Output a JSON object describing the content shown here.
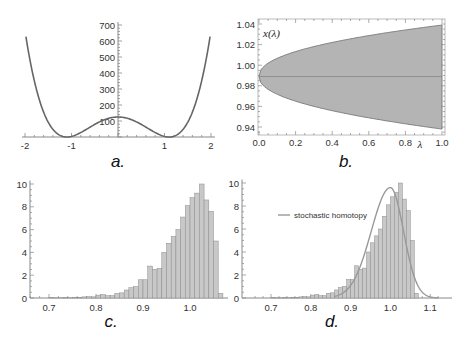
{
  "chart_data": [
    {
      "id": "a",
      "type": "line",
      "panel_label": "a.",
      "title": "",
      "xlabel": "",
      "ylabel": "",
      "x_ticks": [
        "-2",
        "-1",
        "1",
        "2"
      ],
      "y_ticks": [
        "100",
        "200",
        "300",
        "400",
        "500",
        "600",
        "700"
      ],
      "xlim": [
        -2,
        2
      ],
      "ylim": [
        0,
        700
      ],
      "description": "Double-well potential with minima near x = ±1.1 (value ~0) and local max ~125 at x = 0",
      "series": [
        {
          "name": "potential",
          "color": "#666666",
          "x": [
            -2.0,
            -1.8,
            -1.6,
            -1.4,
            -1.2,
            -1.1,
            -1.0,
            -0.8,
            -0.6,
            -0.4,
            -0.2,
            0.0,
            0.2,
            0.4,
            0.6,
            0.8,
            1.0,
            1.1,
            1.2,
            1.4,
            1.6,
            1.8,
            2.0
          ],
          "y": [
            690,
            420,
            225,
            90,
            12,
            0,
            5,
            45,
            88,
            113,
            123,
            125,
            123,
            113,
            88,
            45,
            5,
            0,
            12,
            90,
            225,
            420,
            690
          ]
        }
      ],
      "grid": false
    },
    {
      "id": "b",
      "type": "area",
      "panel_label": "b.",
      "title": "",
      "xlabel": "λ",
      "ylabel": "x(λ)",
      "x_ticks": [
        "0.0",
        "0.2",
        "0.4",
        "0.6",
        "0.8",
        "1.0"
      ],
      "y_ticks": [
        "0.94",
        "0.96",
        "0.98",
        "1.00",
        "1.02",
        "1.04"
      ],
      "xlim": [
        0,
        1
      ],
      "ylim": [
        0.934,
        1.044
      ],
      "series": [
        {
          "name": "upper envelope",
          "x": [
            0.0,
            0.02,
            0.05,
            0.1,
            0.2,
            0.3,
            0.4,
            0.5,
            0.6,
            0.7,
            0.8,
            0.9,
            1.0
          ],
          "y": [
            0.989,
            0.995,
            1.0,
            1.006,
            1.013,
            1.018,
            1.022,
            1.025,
            1.028,
            1.031,
            1.034,
            1.036,
            1.039
          ]
        },
        {
          "name": "lower envelope",
          "x": [
            0.0,
            0.02,
            0.05,
            0.1,
            0.2,
            0.3,
            0.4,
            0.5,
            0.6,
            0.7,
            0.8,
            0.9,
            1.0
          ],
          "y": [
            0.989,
            0.983,
            0.978,
            0.972,
            0.965,
            0.96,
            0.956,
            0.953,
            0.95,
            0.947,
            0.944,
            0.941,
            0.938
          ]
        },
        {
          "name": "mean",
          "x": [
            0.0,
            1.0
          ],
          "y": [
            0.989,
            0.989
          ]
        }
      ],
      "fill_color": "#b4b4b4",
      "grid": false,
      "frame": true
    },
    {
      "id": "c",
      "type": "bar",
      "panel_label": "c.",
      "title": "",
      "xlabel": "",
      "ylabel": "",
      "x_ticks": [
        "0.7",
        "0.8",
        "0.9",
        "1.0"
      ],
      "y_ticks": [
        "0",
        "2",
        "4",
        "6",
        "8",
        "10"
      ],
      "xlim": [
        0.66,
        1.07
      ],
      "ylim": [
        0,
        10
      ],
      "bin_width": 0.01,
      "bin_starts": [
        0.7,
        0.71,
        0.72,
        0.73,
        0.74,
        0.75,
        0.76,
        0.77,
        0.78,
        0.79,
        0.8,
        0.81,
        0.82,
        0.83,
        0.84,
        0.85,
        0.86,
        0.87,
        0.88,
        0.89,
        0.9,
        0.91,
        0.92,
        0.93,
        0.94,
        0.95,
        0.96,
        0.97,
        0.98,
        0.99,
        1.0,
        1.01,
        1.02,
        1.03,
        1.04,
        1.05,
        1.06
      ],
      "values": [
        0.05,
        0.02,
        0.02,
        0.03,
        0.02,
        0.05,
        0.03,
        0.1,
        0.12,
        0.1,
        0.25,
        0.3,
        0.2,
        0.2,
        0.4,
        0.45,
        0.7,
        0.9,
        1.0,
        1.6,
        1.6,
        2.8,
        2.5,
        2.6,
        4.0,
        4.8,
        5.4,
        6.0,
        7.1,
        8.1,
        8.8,
        9.2,
        10.0,
        8.6,
        7.6,
        5.0,
        0.4
      ],
      "bar_color": "#c8c8c8",
      "grid": false
    },
    {
      "id": "d",
      "type": "bar",
      "panel_label": "d.",
      "title": "",
      "xlabel": "",
      "ylabel": "",
      "x_ticks": [
        "0.7",
        "0.8",
        "0.9",
        "1.0",
        "1.1"
      ],
      "y_ticks": [
        "0",
        "2",
        "4",
        "6",
        "8",
        "10"
      ],
      "xlim": [
        0.64,
        1.13
      ],
      "ylim": [
        0,
        10
      ],
      "bin_width": 0.01,
      "bin_starts": [
        0.7,
        0.71,
        0.72,
        0.73,
        0.74,
        0.75,
        0.76,
        0.77,
        0.78,
        0.79,
        0.8,
        0.81,
        0.82,
        0.83,
        0.84,
        0.85,
        0.86,
        0.87,
        0.88,
        0.89,
        0.9,
        0.91,
        0.92,
        0.93,
        0.94,
        0.95,
        0.96,
        0.97,
        0.98,
        0.99,
        1.0,
        1.01,
        1.02,
        1.03,
        1.04,
        1.05,
        1.06
      ],
      "values": [
        0.05,
        0.02,
        0.02,
        0.03,
        0.02,
        0.05,
        0.03,
        0.1,
        0.12,
        0.1,
        0.25,
        0.3,
        0.2,
        0.2,
        0.4,
        0.45,
        0.7,
        0.9,
        1.0,
        1.6,
        1.6,
        2.8,
        2.5,
        2.6,
        4.0,
        4.8,
        5.4,
        6.0,
        7.1,
        8.1,
        8.8,
        9.2,
        10.0,
        8.6,
        7.6,
        5.0,
        0.4
      ],
      "bar_color": "#c8c8c8",
      "legend": [
        {
          "label": "stochastic homotopy",
          "color": "#999999"
        }
      ],
      "legend_position": "upper-left inside",
      "overlay_series": {
        "name": "stochastic homotopy",
        "color": "#999999",
        "x": [
          0.88,
          0.9,
          0.92,
          0.94,
          0.96,
          0.98,
          1.0,
          1.02,
          1.04,
          1.06,
          1.08,
          1.1,
          1.12
        ],
        "y": [
          0.3,
          0.9,
          2.3,
          4.4,
          6.9,
          8.9,
          9.6,
          8.6,
          5.8,
          2.6,
          0.6,
          0.05,
          0.0
        ]
      },
      "grid": false
    }
  ]
}
